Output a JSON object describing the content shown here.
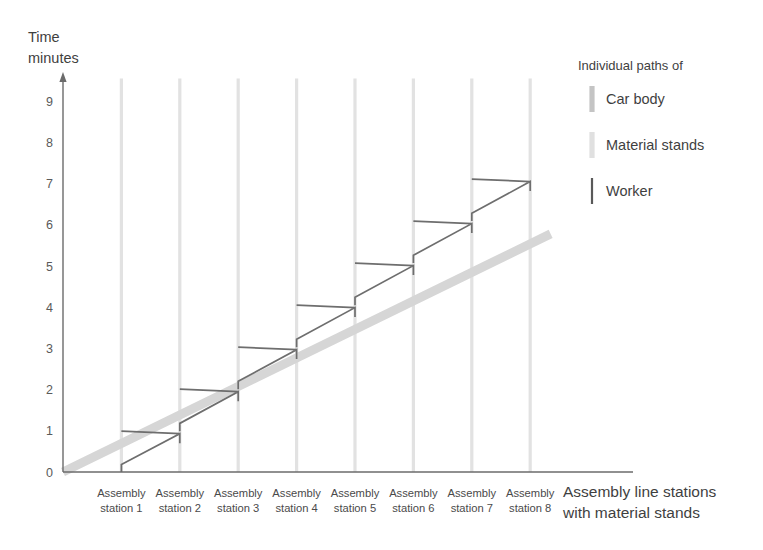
{
  "chart_data": {
    "type": "line",
    "title": "",
    "ylabel": "Time\nminutes",
    "ylabel_lines": [
      "Time",
      "minutes"
    ],
    "xlabel_lines": [
      "Assembly line stations",
      "with material stands"
    ],
    "xlabel": "Assembly line stations with material stands",
    "ylim": [
      0,
      9.6
    ],
    "yticks": [
      0,
      1,
      2,
      3,
      4,
      5,
      6,
      7,
      8,
      9
    ],
    "ytick_labels": [
      "0",
      "1",
      "2",
      "3",
      "4",
      "5",
      "6",
      "7",
      "8",
      "9"
    ],
    "grid": false,
    "categories": [
      "Assembly station 1",
      "Assembly station 2",
      "Assembly station 3",
      "Assembly station 4",
      "Assembly station 5",
      "Assembly station 6",
      "Assembly station 7",
      "Assembly station 8"
    ],
    "category_label_lines": [
      [
        "Assembly",
        "station 1"
      ],
      [
        "Assembly",
        "station 2"
      ],
      [
        "Assembly",
        "station 3"
      ],
      [
        "Assembly",
        "station 4"
      ],
      [
        "Assembly",
        "station 5"
      ],
      [
        "Assembly",
        "station 6"
      ],
      [
        "Assembly",
        "station 7"
      ],
      [
        "Assembly",
        "station 8"
      ]
    ],
    "station_x": [
      1,
      2,
      3,
      4,
      5,
      6,
      7,
      8
    ],
    "series": [
      {
        "name": "Car body",
        "type": "band",
        "color": "#d6d6d6",
        "points": [
          [
            0,
            0
          ],
          [
            8.35,
            5.78
          ]
        ]
      },
      {
        "name": "Material stands",
        "type": "vertical-lines",
        "color": "#e2e2e2",
        "x_positions": [
          1,
          2,
          3,
          4,
          5,
          6,
          7,
          8
        ],
        "y_top": 9.55,
        "y_bottom": 0
      },
      {
        "name": "Worker",
        "type": "zigzag",
        "color": "#6e6e6e",
        "cycles": [
          {
            "station": 1,
            "rise_from": 0.0,
            "rise_to": 0.18,
            "forward_to_x": 2,
            "forward_to_y": 0.93,
            "tick_to": 0.7,
            "back_to_x": 1.0,
            "back_to_y": 0.99
          },
          {
            "station": 2,
            "rise_from": 0.99,
            "rise_to": 1.18,
            "forward_to_x": 3,
            "forward_to_y": 1.95,
            "tick_to": 1.72,
            "back_to_x": 2.0,
            "back_to_y": 2.01
          },
          {
            "station": 3,
            "rise_from": 2.01,
            "rise_to": 2.2,
            "forward_to_x": 4,
            "forward_to_y": 2.97,
            "tick_to": 2.74,
            "back_to_x": 3.0,
            "back_to_y": 3.03
          },
          {
            "station": 4,
            "rise_from": 3.03,
            "rise_to": 3.22,
            "forward_to_x": 5,
            "forward_to_y": 3.99,
            "tick_to": 3.76,
            "back_to_x": 4.0,
            "back_to_y": 4.05
          },
          {
            "station": 5,
            "rise_from": 4.05,
            "rise_to": 4.24,
            "forward_to_x": 6,
            "forward_to_y": 5.01,
            "tick_to": 4.78,
            "back_to_x": 5.0,
            "back_to_y": 5.07
          },
          {
            "station": 6,
            "rise_from": 5.07,
            "rise_to": 5.26,
            "forward_to_x": 7,
            "forward_to_y": 6.03,
            "tick_to": 5.8,
            "back_to_x": 6.0,
            "back_to_y": 6.09
          },
          {
            "station": 7,
            "rise_from": 6.09,
            "rise_to": 6.28,
            "forward_to_x": 8,
            "forward_to_y": 7.05,
            "tick_to": 6.82,
            "back_to_x": 7.0,
            "back_to_y": 7.11
          }
        ]
      }
    ],
    "legend": {
      "position": "top-right",
      "title": "Individual paths of",
      "entries": [
        {
          "label": "Car body",
          "color": "#c4c4c4",
          "swatch": "thick"
        },
        {
          "label": "Material stands",
          "color": "#e0e0e0",
          "swatch": "thick"
        },
        {
          "label": "Worker",
          "color": "#595959",
          "swatch": "thin"
        }
      ]
    },
    "colors": {
      "axis": "#6b6b6b",
      "car_body": "#d6d6d6",
      "material_stand": "#e2e2e2",
      "worker": "#6e6e6e",
      "text": "#3f3f3f",
      "background": "#ffffff"
    }
  }
}
